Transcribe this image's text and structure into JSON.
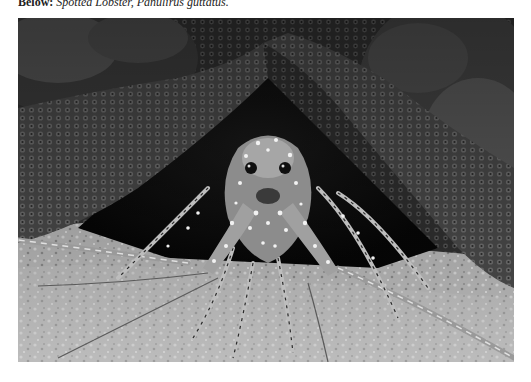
{
  "caption": {
    "lead": "Below:",
    "text": "Spotted Lobster, Panulirus guttatus."
  },
  "photo": {
    "subject": "Spotted Lobster",
    "description": "Grayscale photograph of a spotted spiny lobster sheltering beneath a textured coral overhang, long antennae extending across a sandy, rubble-strewn floor",
    "palette": {
      "coral_dark": "#2e2e2e",
      "coral_mid": "#5a5a5a",
      "coral_light": "#8a8a8a",
      "cave_shadow": "#0c0c0c",
      "floor_light": "#c8c8c8",
      "floor_mid": "#9a9a9a",
      "lobster_spots": "#f2f2f2"
    }
  }
}
